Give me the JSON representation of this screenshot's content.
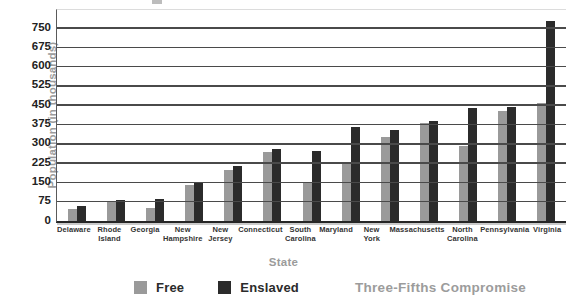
{
  "figure": {
    "y_axis_title": "Population (in thousands)",
    "x_axis_title": "State",
    "caption": "Three-Fifths Compromise"
  },
  "colors": {
    "free_bar": "#9a9a9a",
    "enslaved_bar": "#2b2b2b",
    "gridline": "#4a4a4a",
    "muted_text": "#9b9b9b",
    "dark_text": "#222222"
  },
  "chart_data": {
    "type": "bar",
    "title": "",
    "xlabel": "State",
    "ylabel": "Population (in thousands)",
    "ylim": [
      0,
      750
    ],
    "ytick_step": 75,
    "grid": true,
    "legend_position": "bottom",
    "annotation": "Three-Fifths Compromise",
    "categories": [
      "Delaware",
      "Rhode Island",
      "Georgia",
      "New Hampshire",
      "New Jersey",
      "Connecticut",
      "South Carolina",
      "Maryland",
      "New York",
      "Massachusetts",
      "North Carolina",
      "Pennsylvania",
      "Virginia"
    ],
    "series": [
      {
        "name": "Free",
        "color": "#9a9a9a",
        "values": [
          45,
          72,
          52,
          140,
          198,
          268,
          150,
          225,
          325,
          381,
          292,
          429,
          457
        ]
      },
      {
        "name": "Enslaved",
        "color": "#2b2b2b",
        "values": [
          60,
          80,
          85,
          147,
          214,
          278,
          272,
          365,
          355,
          389,
          438,
          443,
          776
        ]
      }
    ]
  }
}
